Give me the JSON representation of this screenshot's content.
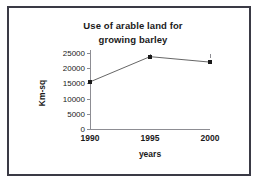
{
  "chart_data": {
    "type": "line",
    "title": "Use of arable land for growing barley",
    "title_line1": "Use of arable land for",
    "title_line2": "growing barley",
    "xlabel": "years",
    "ylabel": "Km-sq",
    "categories": [
      "1990",
      "1995",
      "2000"
    ],
    "x": [
      1990,
      1995,
      2000
    ],
    "values": [
      15500,
      23800,
      22000
    ],
    "series": [
      {
        "name": "Use of arable land for growing barley",
        "values": [
          15500,
          23800,
          22000
        ]
      }
    ],
    "yticks": [
      0,
      5000,
      10000,
      15000,
      20000,
      25000
    ],
    "ytick_labels": [
      "0",
      "5000",
      "10000",
      "15000",
      "20000",
      "25000"
    ],
    "xtick_labels": [
      "1990",
      "1995",
      "2000"
    ],
    "ylim": [
      0,
      25000
    ],
    "xlim": [
      1990,
      2000
    ],
    "grid": false,
    "legend": false,
    "legend_position": "none",
    "marker": "square",
    "line_color": "#555555",
    "marker_color": "#1a1a1a",
    "axis_color": "#8d8d93",
    "text_color": "#1a1a1a",
    "border_color": "#3a3a45",
    "background": "#ffffff"
  }
}
